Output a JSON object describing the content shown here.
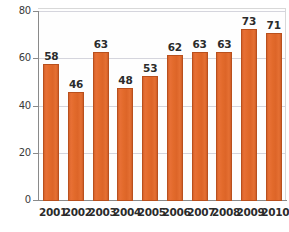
{
  "chart_data": {
    "type": "bar",
    "title": "",
    "subtitle": "",
    "xlabel": "",
    "ylabel": "",
    "categories": [
      "2001",
      "2002",
      "2003",
      "2004",
      "2005",
      "2006",
      "2007",
      "2008",
      "2009",
      "2010"
    ],
    "values": [
      58,
      46,
      63,
      48,
      53,
      62,
      63,
      63,
      73,
      71
    ],
    "series": [
      {
        "name": "",
        "values": [
          58,
          46,
          63,
          48,
          53,
          62,
          63,
          63,
          73,
          71
        ]
      }
    ],
    "data_labels": [
      "58",
      "46",
      "63",
      "48",
      "53",
      "62",
      "63",
      "63",
      "73",
      "71"
    ],
    "ylim": [
      0,
      80
    ],
    "yticks": [
      0,
      20,
      40,
      60,
      80
    ],
    "ytick_labels": [
      "0",
      "20",
      "40",
      "60",
      "80"
    ],
    "grid": true,
    "grid_axis": "y",
    "legend": false,
    "legend_position": "none",
    "bar_color": "#e06a2e",
    "bar_edge_color": "#b9501d",
    "axis_color": "#8a8a8a",
    "gridline_color": "#d5d5dd",
    "label_color": "#2b2b2b",
    "background_color": "#ffffff"
  }
}
